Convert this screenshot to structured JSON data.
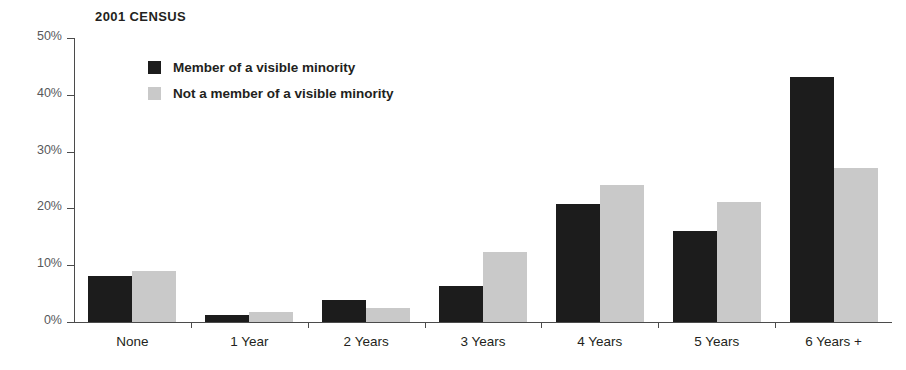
{
  "chart_data": {
    "type": "bar",
    "title": "2001 CENSUS",
    "xlabel": "",
    "ylabel": "",
    "ylim": [
      0,
      50
    ],
    "ytick_values": [
      0,
      10,
      20,
      30,
      40,
      50
    ],
    "ytick_labels": [
      "0%",
      "10%",
      "20%",
      "30%",
      "40%",
      "50%"
    ],
    "grid": false,
    "legend_position": "upper-left-inside",
    "categories": [
      "None",
      "1 Year",
      "2 Years",
      "3 Years",
      "4 Years",
      "5 Years",
      "6 Years +"
    ],
    "series": [
      {
        "name": "Member of a visible minority",
        "color": "#1c1c1c",
        "values": [
          8.1,
          1.2,
          3.8,
          6.4,
          20.8,
          16.1,
          43.1
        ]
      },
      {
        "name": "Not a member of a visible minority",
        "color": "#c9c9c9",
        "values": [
          8.9,
          1.7,
          2.4,
          12.4,
          24.2,
          21.2,
          27.2
        ]
      }
    ]
  },
  "axis": {
    "y_unit_suffix": "%"
  }
}
